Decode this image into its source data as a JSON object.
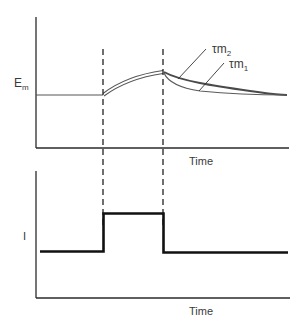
{
  "diagram": {
    "type": "membrane-potential-response",
    "top_panel": {
      "ylabel_main": "E",
      "ylabel_sub": "m",
      "xlabel": "Time",
      "curves": [
        {
          "name": "tau-m2",
          "label_main": "τm",
          "label_sub": "2",
          "description": "slower decay (upper trace)"
        },
        {
          "name": "tau-m1",
          "label_main": "τm",
          "label_sub": "1",
          "description": "faster decay (lower trace)"
        }
      ]
    },
    "bottom_panel": {
      "ylabel": "I",
      "xlabel": "Time",
      "trace": "rectangular current pulse"
    },
    "markers": {
      "pulse_on": "dashed line",
      "pulse_off": "dashed line"
    },
    "colors": {
      "axis": "#2a2a2a",
      "trace_top": "#555555",
      "trace_bottom": "#111111",
      "dashed": "#222222",
      "text": "#3a3a3a"
    }
  }
}
